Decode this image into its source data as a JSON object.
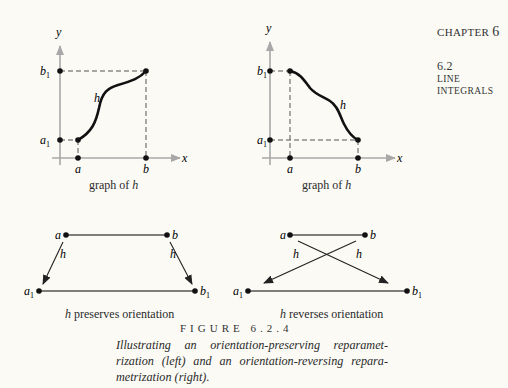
{
  "header": {
    "chapter_label": "CHAPTER",
    "chapter_number": "6",
    "section_number": "6.2",
    "section_title_line1": "LINE",
    "section_title_line2": "INTEGRALS"
  },
  "graphs": {
    "left": {
      "caption_prefix": "graph of ",
      "caption_var": "h",
      "x_axis": "x",
      "y_axis": "y",
      "x_ticks": [
        "a",
        "b"
      ],
      "y_ticks": [
        "a",
        "b"
      ],
      "y_tick_subscript": "1",
      "curve_label": "h"
    },
    "right": {
      "caption_prefix": "graph of ",
      "caption_var": "h",
      "x_axis": "x",
      "y_axis": "y",
      "x_ticks": [
        "a",
        "b"
      ],
      "y_ticks": [
        "a",
        "b"
      ],
      "y_tick_subscript": "1",
      "curve_label": "h"
    }
  },
  "mappings": {
    "left": {
      "top_points": [
        "a",
        "b"
      ],
      "bottom_points": [
        "a",
        "b"
      ],
      "subscript": "1",
      "arrow_labels": [
        "h",
        "h"
      ],
      "caption_var": "h",
      "caption_text": " preserves orientation"
    },
    "right": {
      "top_points": [
        "a",
        "b"
      ],
      "bottom_points": [
        "a",
        "b"
      ],
      "subscript": "1",
      "arrow_labels": [
        "h",
        "h"
      ],
      "caption_var": "h",
      "caption_text": " reverses orientation"
    }
  },
  "figure": {
    "title": "FIGURE 6.2.4",
    "caption_lines": [
      "Illustrating an orientation-preserving reparamet-",
      "rization (left) and an orientation-reversing repara-",
      "metrization (right)."
    ]
  },
  "colors": {
    "axis": "#a8a8a8",
    "curve": "#111111",
    "dashed": "#555555",
    "text": "#2a2a2a",
    "background": "#fbfaf5"
  }
}
